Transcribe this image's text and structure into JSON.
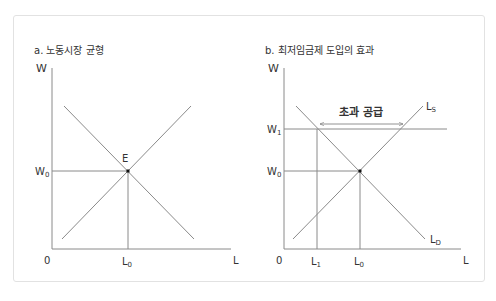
{
  "panels": [
    {
      "title": "a. 노동시장 균형",
      "y_axis_label": "W",
      "x_axis_label": "L",
      "origin_label": "0",
      "wage_label": "W",
      "wage_sub": "0",
      "labor_label": "L",
      "labor_sub": "0",
      "equilibrium_label": "E"
    },
    {
      "title": "b. 최저임금제 도입의 효과",
      "y_axis_label": "W",
      "x_axis_label": "L",
      "origin_label": "0",
      "min_wage_label": "W",
      "min_wage_sub": "1",
      "wage_label": "W",
      "wage_sub": "0",
      "l1_label": "L",
      "l1_sub": "1",
      "l0_label": "L",
      "l0_sub": "0",
      "supply_label": "L",
      "supply_sub": "S",
      "demand_label": "L",
      "demand_sub": "D",
      "surplus_label": "초과 공급"
    }
  ],
  "colors": {
    "line": "#8a8a8a",
    "text": "#333333",
    "frame": "#e2e2e2"
  }
}
